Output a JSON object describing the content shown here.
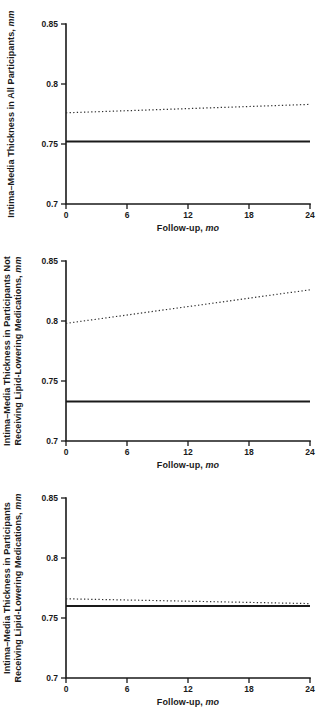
{
  "figure": {
    "background": "#ffffff",
    "panel_count": 3
  },
  "colors": {
    "axis": "#1a1a1a",
    "solid_line": "#1a1a1a",
    "dotted_line": "#2e2e2e",
    "text": "#1a1a1a",
    "background": "#ffffff"
  },
  "chart_data": [
    {
      "type": "line",
      "id": "all-participants",
      "ylabel": {
        "lines": [
          "Intima–Media Thickness in All Participants,"
        ],
        "unit": "mm"
      },
      "xlabel": {
        "text": "Follow-up,",
        "unit": "mo"
      },
      "xlim": [
        0,
        24
      ],
      "ylim": [
        0.7,
        0.85
      ],
      "xticks": [
        "0",
        "6",
        "12",
        "18",
        "24"
      ],
      "yticks": [
        "0.7",
        "0.75",
        "0.8",
        "0.85"
      ],
      "grid": false,
      "legend": "none",
      "series": [
        {
          "name": "dotted-trend",
          "style": "dotted",
          "x": [
            0,
            24
          ],
          "y": [
            0.776,
            0.783
          ]
        },
        {
          "name": "solid-trend",
          "style": "solid",
          "x": [
            0,
            24
          ],
          "y": [
            0.752,
            0.752
          ]
        }
      ]
    },
    {
      "type": "line",
      "id": "not-receiving-lipid-lowering-medications",
      "ylabel": {
        "lines": [
          "Intima–Media Thickness in Participants Not",
          "Receiving Lipid-Lowering Medications,"
        ],
        "unit": "mm"
      },
      "xlabel": {
        "text": "Follow-up,",
        "unit": "mo"
      },
      "xlim": [
        0,
        24
      ],
      "ylim": [
        0.7,
        0.85
      ],
      "xticks": [
        "0",
        "6",
        "12",
        "18",
        "24"
      ],
      "yticks": [
        "0.7",
        "0.75",
        "0.8",
        "0.85"
      ],
      "grid": false,
      "legend": "none",
      "series": [
        {
          "name": "dotted-trend",
          "style": "dotted",
          "x": [
            0,
            24
          ],
          "y": [
            0.798,
            0.826
          ]
        },
        {
          "name": "solid-trend",
          "style": "solid",
          "x": [
            0,
            24
          ],
          "y": [
            0.733,
            0.733
          ]
        }
      ]
    },
    {
      "type": "line",
      "id": "receiving-lipid-lowering-medications",
      "ylabel": {
        "lines": [
          "Intima–Media Thickness in Participants",
          "Receiving Lipid-Lowering Medications,"
        ],
        "unit": "mm"
      },
      "xlabel": {
        "text": "Follow-up,",
        "unit": "mo"
      },
      "xlim": [
        0,
        24
      ],
      "ylim": [
        0.7,
        0.85
      ],
      "xticks": [
        "0",
        "6",
        "12",
        "18",
        "24"
      ],
      "yticks": [
        "0.7",
        "0.75",
        "0.8",
        "0.85"
      ],
      "grid": false,
      "legend": "none",
      "series": [
        {
          "name": "dotted-trend",
          "style": "dotted",
          "x": [
            0,
            24
          ],
          "y": [
            0.766,
            0.762
          ]
        },
        {
          "name": "solid-trend",
          "style": "solid",
          "x": [
            0,
            24
          ],
          "y": [
            0.76,
            0.76
          ]
        }
      ]
    }
  ]
}
